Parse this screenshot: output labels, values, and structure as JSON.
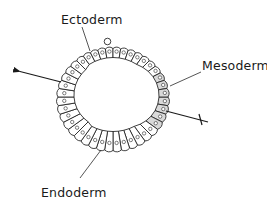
{
  "diagram": {
    "title": "",
    "labels": {
      "ectoderm": "Ectoderm",
      "mesoderm": "Mesoderm",
      "endoderm": "Endoderm"
    },
    "colors": {
      "line": "#1f1f1f",
      "cell_fill": "#ffffff",
      "mesoderm_fill": "#d9d9d9",
      "background": "#ffffff"
    },
    "elements": {
      "left_arrow": "arrow pointing outward to the left",
      "right_axis_line": "line with tick mark extending to the right",
      "top_bump": "small round protrusion on top of cell ring"
    }
  }
}
